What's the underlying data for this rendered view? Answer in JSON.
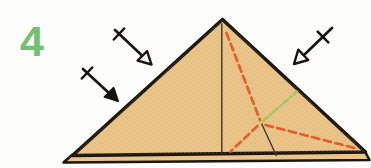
{
  "step_number": "4",
  "diagram": {
    "type": "origami-instruction-step",
    "colors": {
      "background": "#fdfdfb",
      "step_number_green": "#73c071",
      "paper_fill": "#eac488",
      "paper_texture_dot": "#d8a660",
      "outline_black": "#1b1710",
      "crease_black": "#3a352c",
      "fold_line_red": "#e45e2b",
      "fold_line_green": "#9fc75f",
      "arrow_black": "#161310",
      "open_arrowhead_fill": "#ffffff"
    },
    "icons": [
      "fold-arrow-open-top-left-icon",
      "fold-arrow-filled-left-icon",
      "fold-arrow-open-right-icon",
      "repeat-tick-icon"
    ]
  }
}
